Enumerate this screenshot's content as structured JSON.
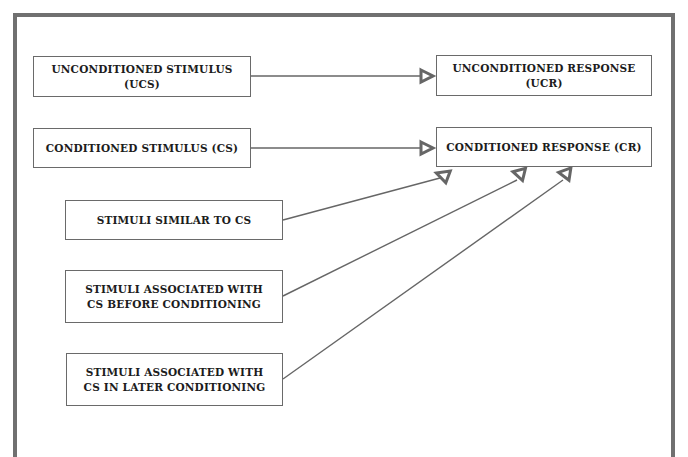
{
  "diagram": {
    "type": "classical-conditioning-flow",
    "colors": {
      "frame": "#707070",
      "box_border": "#6a6a6a",
      "connector": "#666666",
      "text": "#1c1c1c",
      "background": "#ffffff"
    },
    "nodes": {
      "ucs": {
        "label": "UNCONDITIONED STIMULUS (UCS)"
      },
      "ucr": {
        "label": "UNCONDITIONED RESPONSE (UCR)"
      },
      "cs": {
        "label": "CONDITIONED STIMULUS (CS)"
      },
      "cr": {
        "label": "CONDITIONED RESPONSE (CR)"
      },
      "similar": {
        "label": "STIMULI SIMILAR TO CS"
      },
      "before": {
        "line1": "STIMULI ASSOCIATED WITH",
        "line2": "CS BEFORE CONDITIONING"
      },
      "later": {
        "line1": "STIMULI ASSOCIATED WITH",
        "line2": "CS IN LATER CONDITIONING"
      }
    },
    "edges": [
      {
        "from": "ucs",
        "to": "ucr"
      },
      {
        "from": "cs",
        "to": "cr"
      },
      {
        "from": "similar",
        "to": "cr"
      },
      {
        "from": "before",
        "to": "cr"
      },
      {
        "from": "later",
        "to": "cr"
      }
    ]
  }
}
